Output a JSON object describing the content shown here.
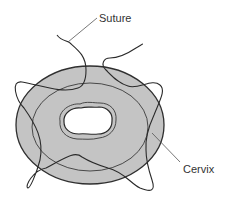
{
  "diagram": {
    "type": "medical-illustration",
    "labels": {
      "suture": "Suture",
      "cervix": "Cervix"
    },
    "colors": {
      "cervix_fill": "#c4c4c4",
      "outline": "#2f2f2f",
      "os_fill": "#ffffff",
      "background": "#ffffff"
    }
  }
}
